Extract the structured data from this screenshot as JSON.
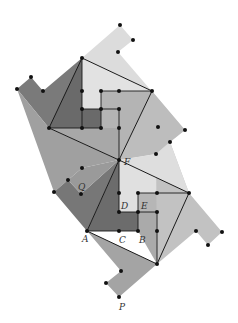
{
  "figure": {
    "colors": {
      "background": "#ffffff",
      "darkest": "#6f6f6f",
      "dark": "#858585",
      "medium": "#a6a6a6",
      "light": "#c4c4c4",
      "lightest": "#dedede",
      "line": "#1a1a1a",
      "dot": "#111111"
    },
    "labels": [
      {
        "id": "F",
        "text": "F",
        "x": 124,
        "y": 165
      },
      {
        "id": "Q",
        "text": "Q",
        "x": 78,
        "y": 190
      },
      {
        "id": "D",
        "text": "D",
        "x": 121,
        "y": 209
      },
      {
        "id": "E",
        "text": "E",
        "x": 141,
        "y": 209
      },
      {
        "id": "A",
        "text": "A",
        "x": 82,
        "y": 242
      },
      {
        "id": "C",
        "text": "C",
        "x": 119,
        "y": 243
      },
      {
        "id": "B",
        "text": "B",
        "x": 139,
        "y": 243
      },
      {
        "id": "P",
        "text": "P",
        "x": 119,
        "y": 310
      }
    ]
  }
}
